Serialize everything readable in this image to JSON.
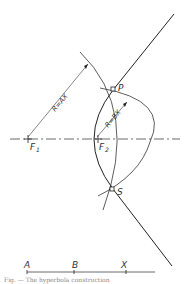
{
  "figure": {
    "labels": {
      "P": "P",
      "S": "S",
      "F1": "F",
      "F1_sub": "1",
      "F2": "F",
      "F2_sub": "2",
      "radius_AX": "R=AX",
      "radius_BX": "R=BX",
      "A": "A",
      "B": "B",
      "X": "X"
    },
    "caption": "Fig. — The hyperbola construction"
  }
}
